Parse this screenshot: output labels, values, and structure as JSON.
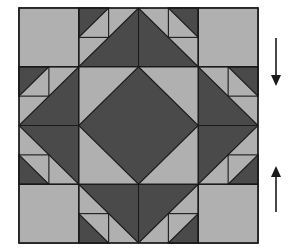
{
  "figure": {
    "kind": "quilt-block-diagram",
    "title": "",
    "colors": {
      "light": "#b0b0b0",
      "dark": "#4a4a4a",
      "outline": "#1a1a1a",
      "background": "#ffffff",
      "arrow": "#1a1a1a"
    },
    "block": {
      "x": 19,
      "y": 8,
      "width": 239,
      "height": 235,
      "grid_rows": 4,
      "grid_cols": 4,
      "cell_width": 59.75,
      "cell_height": 58.75,
      "stroke_width": 1.1
    },
    "arrows": [
      {
        "name": "arrow-down",
        "direction": "down",
        "x": 276,
        "y_start": 38,
        "y_end": 86,
        "head_length": 11,
        "head_half_width": 5,
        "shaft_width": 1.6
      },
      {
        "name": "arrow-up",
        "direction": "up",
        "x": 276,
        "y_start": 212,
        "y_end": 166,
        "head_length": 11,
        "head_half_width": 5,
        "shaft_width": 1.6
      }
    ],
    "units": [
      {
        "name": "corner-unit-top-left",
        "row": 0,
        "col": 0,
        "type": "plain-light"
      },
      {
        "name": "flying-geese-top-left",
        "row": 0,
        "col": 1,
        "type": "half-square-with-small-triangle",
        "orientation": "tl-small-dark"
      },
      {
        "name": "flying-geese-top-right",
        "row": 0,
        "col": 2,
        "type": "half-square-with-small-triangle",
        "orientation": "tr-small-dark"
      },
      {
        "name": "corner-unit-top-right",
        "row": 0,
        "col": 3,
        "type": "plain-light"
      },
      {
        "name": "flying-geese-left-top",
        "row": 1,
        "col": 0,
        "type": "half-square-with-small-triangle",
        "orientation": "lt-small-dark"
      },
      {
        "name": "center-unit-nw",
        "row": 1,
        "col": 1,
        "type": "quarter-diamond-nw"
      },
      {
        "name": "center-unit-ne",
        "row": 1,
        "col": 2,
        "type": "quarter-diamond-ne"
      },
      {
        "name": "flying-geese-right-top",
        "row": 1,
        "col": 3,
        "type": "half-square-with-small-triangle",
        "orientation": "rt-small-dark"
      },
      {
        "name": "flying-geese-left-bottom",
        "row": 2,
        "col": 0,
        "type": "half-square-with-small-triangle",
        "orientation": "lb-small-dark"
      },
      {
        "name": "center-unit-sw",
        "row": 2,
        "col": 1,
        "type": "quarter-diamond-sw"
      },
      {
        "name": "center-unit-se",
        "row": 2,
        "col": 2,
        "type": "quarter-diamond-se"
      },
      {
        "name": "flying-geese-right-bottom",
        "row": 2,
        "col": 3,
        "type": "half-square-with-small-triangle",
        "orientation": "rb-small-dark"
      },
      {
        "name": "corner-unit-bottom-left",
        "row": 3,
        "col": 0,
        "type": "plain-light"
      },
      {
        "name": "flying-geese-bottom-left",
        "row": 3,
        "col": 1,
        "type": "half-square-with-small-triangle",
        "orientation": "bl-small-dark"
      },
      {
        "name": "flying-geese-bottom-right",
        "row": 3,
        "col": 2,
        "type": "half-square-with-small-triangle",
        "orientation": "br-small-dark"
      },
      {
        "name": "corner-unit-bottom-right",
        "row": 3,
        "col": 3,
        "type": "plain-light"
      }
    ]
  }
}
